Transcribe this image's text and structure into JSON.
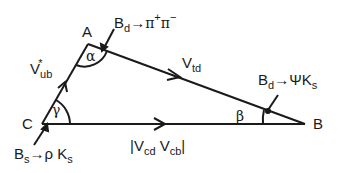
{
  "diagram": {
    "vertices": {
      "A": "A",
      "B": "B",
      "C": "C"
    },
    "angles": {
      "alpha": "α",
      "beta": "β",
      "gamma": "γ"
    },
    "sides": {
      "CA": {
        "main": "V",
        "sub": "ub",
        "sup": "*"
      },
      "AB": {
        "main": "V",
        "sub": "td"
      },
      "CB": {
        "open": "|V",
        "sub1": "cd",
        "mid": " V",
        "sub2": "cb",
        "close": "|"
      }
    },
    "decays": {
      "alpha": {
        "b": "B",
        "b_sub": "d",
        "arrow": "→",
        "prod": "π",
        "sup1": "+",
        "prod2": "π",
        "sup2": "−"
      },
      "beta": {
        "b": "B",
        "b_sub": "d",
        "arrow": "→",
        "prod": "ΨK",
        "sub": "s"
      },
      "gamma": {
        "b": "B",
        "b_sub": "s",
        "arrow": "→",
        "prod": "ρ K",
        "sub": "s"
      }
    }
  }
}
